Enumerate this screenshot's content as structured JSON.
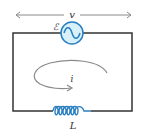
{
  "diagram": {
    "type": "circuit",
    "labels": {
      "voltage": "v",
      "emf": "ℰ",
      "current": "i",
      "inductor": "L"
    },
    "components": [
      {
        "id": "ac-source",
        "kind": "ac-voltage-source",
        "label_ref": "emf",
        "position": "top"
      },
      {
        "id": "inductor",
        "kind": "inductor",
        "label_ref": "inductor",
        "position": "bottom",
        "loops": 6
      }
    ],
    "annotations": [
      {
        "id": "voltage-arrow",
        "kind": "double-headed-arrow",
        "label_ref": "voltage",
        "position": "above-circuit"
      },
      {
        "id": "current-arrow",
        "kind": "circular-arrow",
        "label_ref": "current",
        "position": "inside-loop"
      }
    ],
    "colors": {
      "wire": "#333333",
      "component": "#2a7fc0",
      "source_fill": "#d8f0fa",
      "arrow": "#8a8a8a",
      "label": "#333333"
    }
  }
}
